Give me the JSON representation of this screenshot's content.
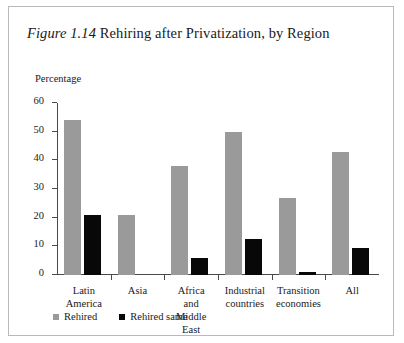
{
  "figure": {
    "number": "Figure 1.14",
    "title": " Rehiring after Privatization, by Region"
  },
  "chart_data": {
    "type": "bar",
    "title": "Figure 1.14 Rehiring after Privatization, by Region",
    "xlabel": "",
    "ylabel": "Percentage",
    "ylim": [
      0,
      60
    ],
    "yticks": [
      0,
      10,
      20,
      30,
      40,
      50,
      60
    ],
    "grid": false,
    "legend_position": "bottom-left",
    "categories": [
      "Latin America",
      "Asia",
      "Africa and\nMiddle East",
      "Industrial\ncountries",
      "Transition\neconomies",
      "All"
    ],
    "series": [
      {
        "name": "Rehired",
        "color": "#9a9a9a",
        "values": [
          54,
          21,
          38,
          50,
          27,
          43
        ]
      },
      {
        "name": "Rehired same",
        "color": "#080808",
        "values": [
          21,
          0,
          6,
          12.5,
          1,
          9.5
        ]
      }
    ]
  },
  "axis": {
    "tick_labels": [
      "60",
      "50",
      "40",
      "30",
      "20",
      "10",
      "0"
    ]
  },
  "legend": {
    "items": [
      {
        "label": "Rehired",
        "swatch": "rehired"
      },
      {
        "label": "Rehired same",
        "swatch": "rehired-same"
      }
    ]
  }
}
